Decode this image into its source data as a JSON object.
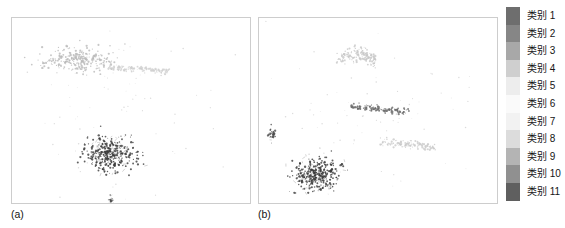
{
  "figure": {
    "background_color": "#ffffff",
    "panel_border_color": "#cdcdcd"
  },
  "panels": [
    {
      "id": "a",
      "caption": "(a)"
    },
    {
      "id": "b",
      "caption": "(b)"
    }
  ],
  "legend": {
    "position": "right",
    "orientation": "vertical",
    "items": [
      {
        "label": "类别 1",
        "color": "#6e6e6e"
      },
      {
        "label": "类别 2",
        "color": "#868686"
      },
      {
        "label": "类别 3",
        "color": "#a8a8a8"
      },
      {
        "label": "类别 4",
        "color": "#cfcfcf"
      },
      {
        "label": "类别 5",
        "color": "#ededed"
      },
      {
        "label": "类别 6",
        "color": "#fafafa"
      },
      {
        "label": "类别 7",
        "color": "#f2f2f2"
      },
      {
        "label": "类别 8",
        "color": "#dcdcdc"
      },
      {
        "label": "类别 9",
        "color": "#b4b4b4"
      },
      {
        "label": "类别 10",
        "color": "#909090"
      },
      {
        "label": "类别 11",
        "color": "#5f5f5f"
      }
    ]
  },
  "chart_data": {
    "type": "scatter",
    "title": "",
    "xlabel": "",
    "ylabel": "",
    "grid": false,
    "axis_ticks": false,
    "xlim": [
      0,
      240
    ],
    "ylim": [
      0,
      187
    ],
    "legend_position": "right",
    "subplots": [
      {
        "id": "a",
        "caption": "(a)",
        "clusters": [
          {
            "name": "light-diffuse-upper-left",
            "legend_label": "类别 5",
            "color": "#b9b9b9",
            "center": [
              68,
              42
            ],
            "spread": [
              34,
              12
            ],
            "n_points": 260
          },
          {
            "name": "light-streak-upper-right",
            "legend_label": "类别 6",
            "color": "#cfcfcf",
            "center": [
              128,
              52
            ],
            "spread": [
              32,
              7
            ],
            "n_points": 120
          },
          {
            "name": "dark-dense-lower-center",
            "legend_label": "类别 11",
            "color": "#3a3a3a",
            "center": [
              100,
              137
            ],
            "spread": [
              22,
              15
            ],
            "n_points": 340
          },
          {
            "name": "dark-small-bottom",
            "legend_label": "类别 10",
            "color": "#4a4a4a",
            "center": [
              100,
              186
            ],
            "spread": [
              3,
              6
            ],
            "n_points": 30
          },
          {
            "name": "sparse-background-specks",
            "legend_label": "类别 8",
            "color": "#b0b0b0",
            "center": [
              120,
              95
            ],
            "spread": [
              100,
              70
            ],
            "n_points": 70
          }
        ]
      },
      {
        "id": "b",
        "caption": "(b)",
        "clusters": [
          {
            "name": "light-arc-upper-center",
            "legend_label": "类别 5",
            "color": "#c7c7c7",
            "center": [
              98,
              48
            ],
            "spread": [
              20,
              20
            ],
            "n_points": 150
          },
          {
            "name": "mid-gray-band-center",
            "legend_label": "类别 9",
            "color": "#6a6a6a",
            "center": [
              122,
              92
            ],
            "spread": [
              30,
              8
            ],
            "n_points": 130
          },
          {
            "name": "light-streak-right",
            "legend_label": "类别 6",
            "color": "#cbcbcb",
            "center": [
              150,
              128
            ],
            "spread": [
              28,
              10
            ],
            "n_points": 110
          },
          {
            "name": "dark-dense-lower-left",
            "legend_label": "类别 11",
            "color": "#3a3a3a",
            "center": [
              58,
              158
            ],
            "spread": [
              20,
              14
            ],
            "n_points": 330
          },
          {
            "name": "dark-sliver-left",
            "legend_label": "类别 10",
            "color": "#4d4d4d",
            "center": [
              13,
              118
            ],
            "spread": [
              3,
              7
            ],
            "n_points": 28
          },
          {
            "name": "sparse-background-specks",
            "legend_label": "类别 8",
            "color": "#b0b0b0",
            "center": [
              120,
              95
            ],
            "spread": [
              100,
              70
            ],
            "n_points": 70
          }
        ]
      }
    ]
  }
}
